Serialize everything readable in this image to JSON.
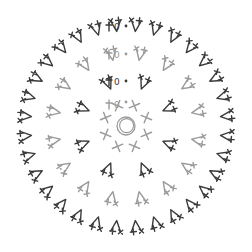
{
  "diagram": {
    "type": "crochet-round-chart",
    "title": "",
    "center": {
      "x": 126,
      "y": 126
    },
    "colors": {
      "dark": "#3a3a3a",
      "light": "#9a9a9a",
      "background": "#ffffff"
    },
    "magic_ring": {
      "radius": 9,
      "color": "#9a9a9a",
      "symbol": "magic-ring"
    },
    "rounds": [
      {
        "round": 1,
        "color": "light",
        "radius": 22,
        "count": 8,
        "symbol": "sc",
        "start_label": "0",
        "start_marker": "dot"
      },
      {
        "round": 2,
        "color": "dark",
        "radius": 45,
        "count": 8,
        "symbol": "sc-inc",
        "start_label": "0",
        "start_marker": "dot"
      },
      {
        "round": 3,
        "color": "light",
        "radius": 72,
        "count": 16,
        "symbol": "sc-inc",
        "start_label": "0",
        "start_marker": "dot"
      },
      {
        "round": 4,
        "color": "dark",
        "radius": 100,
        "count": 32,
        "symbol": "sc-inc",
        "start_label": "0",
        "start_marker": "dot"
      }
    ],
    "legend": []
  }
}
